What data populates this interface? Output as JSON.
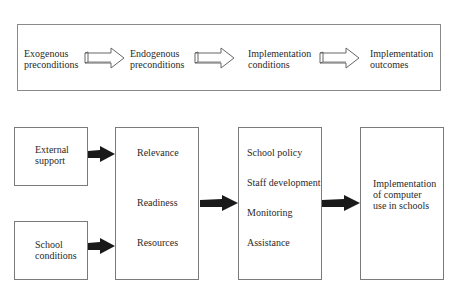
{
  "top_sequence": {
    "stages": [
      {
        "label": "Exogenous\npreconditions"
      },
      {
        "label": "Endogenous\npreconditions"
      },
      {
        "label": "Implementation\nconditions"
      },
      {
        "label": "Implementation\noutcomes"
      }
    ],
    "arrow_style": "outline-3d"
  },
  "model": {
    "inputs": [
      {
        "label": "External\nsupport"
      },
      {
        "label": "School\nconditions"
      }
    ],
    "preconditions": {
      "items": [
        "Relevance",
        "Readiness",
        "Resources"
      ]
    },
    "conditions": {
      "items": [
        "School policy",
        "Staff development",
        "Monitoring",
        "Assistance"
      ]
    },
    "outcome": {
      "label": "Implementation\nof computer\nuse in schools"
    },
    "arrow_color": "#1a1a1a"
  }
}
